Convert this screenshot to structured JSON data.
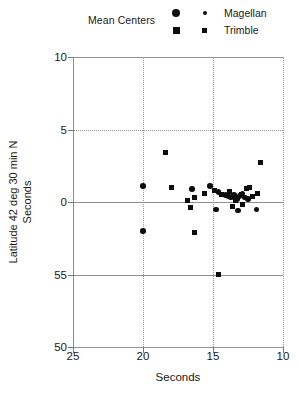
{
  "legend": {
    "title": "Mean Centers",
    "entries": [
      {
        "label": "Magellan",
        "marker": "circle-icon"
      },
      {
        "label": "Trimble",
        "marker": "square-icon"
      }
    ]
  },
  "axes": {
    "x": {
      "title": "Seconds",
      "ticks": [
        "25",
        "20",
        "15",
        "10"
      ],
      "values": [
        25,
        20,
        15,
        10
      ],
      "min": 25,
      "max": 10,
      "reversed": true
    },
    "y": {
      "title_line1": "Latitude 42 deg 30 min N",
      "title_line2": "Seconds",
      "ticks": [
        "10",
        "5",
        "0",
        "55",
        "50"
      ],
      "values": [
        10,
        5,
        0,
        -5,
        -10
      ]
    }
  },
  "colors": {
    "marker": "#0d0d0d",
    "axis": "#8c8c8c",
    "grid": "#9a9a9a",
    "background": "#ffffff",
    "text": "#1a1a1a"
  },
  "chart_data": {
    "type": "scatter",
    "title": "",
    "xlabel": "Seconds",
    "ylabel": "Latitude 42 deg 30 min N Seconds",
    "xlim": [
      25,
      10
    ],
    "ylim": [
      -10,
      10
    ],
    "x_ticks": [
      25,
      20,
      15,
      10
    ],
    "y_ticks": [
      10,
      5,
      0,
      -5,
      -10
    ],
    "y_tick_labels": [
      "10",
      "5",
      "0",
      "55",
      "50"
    ],
    "grid": true,
    "legend_position": "above-plot",
    "series": [
      {
        "name": "Magellan",
        "marker": "circle",
        "points": [
          [
            20.0,
            1.1
          ],
          [
            20.0,
            -2.0
          ],
          [
            16.5,
            0.9
          ],
          [
            15.2,
            1.1
          ],
          [
            14.6,
            0.7
          ],
          [
            14.1,
            0.5
          ],
          [
            13.9,
            0.4
          ],
          [
            13.7,
            0.3
          ],
          [
            13.5,
            0.5
          ],
          [
            13.3,
            0.2
          ],
          [
            13.1,
            0.4
          ],
          [
            12.9,
            0.6
          ],
          [
            12.7,
            0.3
          ],
          [
            12.5,
            0.2
          ],
          [
            14.8,
            -0.5
          ],
          [
            13.2,
            -0.6
          ],
          [
            11.9,
            -0.5
          ]
        ]
      },
      {
        "name": "Trimble",
        "marker": "square",
        "points": [
          [
            18.4,
            3.4
          ],
          [
            11.6,
            2.7
          ],
          [
            18.0,
            1.0
          ],
          [
            16.8,
            0.1
          ],
          [
            16.3,
            0.3
          ],
          [
            15.6,
            0.6
          ],
          [
            14.9,
            0.8
          ],
          [
            14.4,
            0.5
          ],
          [
            13.8,
            0.7
          ],
          [
            13.4,
            0.1
          ],
          [
            13.0,
            0.5
          ],
          [
            12.6,
            0.9
          ],
          [
            12.2,
            0.4
          ],
          [
            12.4,
            1.0
          ],
          [
            11.8,
            0.6
          ],
          [
            16.6,
            -0.4
          ],
          [
            13.6,
            -0.3
          ],
          [
            12.9,
            -0.2
          ],
          [
            16.3,
            -2.1
          ],
          [
            14.6,
            -5.0
          ]
        ]
      }
    ]
  }
}
